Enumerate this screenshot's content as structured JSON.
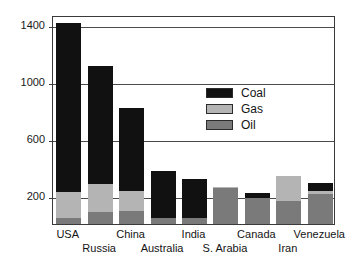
{
  "chart_data": {
    "type": "bar",
    "subtype": "stacked",
    "title": "",
    "xlabel": "",
    "ylabel": "",
    "ylim": [
      0,
      1470
    ],
    "grid": true,
    "y_ticks": [
      200,
      600,
      1000,
      1400
    ],
    "y_tick_labels": [
      "200",
      "600",
      "1000",
      "1400"
    ],
    "legend_position": "inside-upper-right",
    "categories": [
      "USA",
      "Russia",
      "China",
      "Australia",
      "India",
      "S. Arabia",
      "Canada",
      "Iran",
      "Venezuela"
    ],
    "series": [
      {
        "name": "Oil",
        "color": "#7a7a7a",
        "values": [
          45,
          85,
          95,
          45,
          45,
          250,
          180,
          165,
          210
        ]
      },
      {
        "name": "Gas",
        "color": "#b4b4b4",
        "values": [
          180,
          200,
          140,
          0,
          0,
          10,
          0,
          175,
          25
        ]
      },
      {
        "name": "Coal",
        "color": "#111111",
        "values": [
          1190,
          830,
          580,
          330,
          275,
          0,
          35,
          0,
          55
        ]
      }
    ],
    "totals": [
      1415,
      1115,
      815,
      375,
      320,
      260,
      215,
      340,
      290
    ],
    "legend_entries": [
      {
        "label": "Coal",
        "color": "#111111"
      },
      {
        "label": "Gas",
        "color": "#b4b4b4"
      },
      {
        "label": "Oil",
        "color": "#7a7a7a"
      }
    ]
  },
  "colors": {
    "coal": "#111111",
    "gas": "#b4b4b4",
    "oil": "#7a7a7a",
    "axis": "#3a3a3a",
    "grid": "#4a4a4a",
    "background": "#ffffff",
    "text": "#141414"
  }
}
